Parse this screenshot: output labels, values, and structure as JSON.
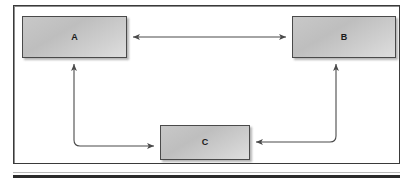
{
  "diagram": {
    "title": "",
    "frame": {
      "border_color": "#3a3a3a",
      "background": "#ffffff"
    },
    "rule": {
      "color": "#2b2b2b"
    },
    "node_style": {
      "fill_light": "#dedede",
      "fill_dark": "#c8c8c8",
      "border_color": "#4a4a4a",
      "shadow_color": "#5a5a5a",
      "label_color": "#1a1a1a"
    },
    "edge_style": {
      "color": "#4a4a4a",
      "width": 1
    },
    "nodes": [
      {
        "id": "A",
        "label": "A",
        "x": 22,
        "y": 16,
        "w": 105,
        "h": 42
      },
      {
        "id": "B",
        "label": "B",
        "x": 292,
        "y": 16,
        "w": 104,
        "h": 42
      },
      {
        "id": "C",
        "label": "C",
        "x": 160,
        "y": 125,
        "w": 90,
        "h": 35
      }
    ],
    "edges": [
      {
        "id": "a-b",
        "from": "A",
        "to": "B",
        "shape": "straight-horizontal",
        "arrowheads": "both",
        "from_side": "right",
        "to_side": "left"
      },
      {
        "id": "a-c",
        "from": "A",
        "to": "C",
        "shape": "elbow-down-right",
        "arrowheads": "both",
        "from_side": "bottom",
        "to_side": "left"
      },
      {
        "id": "c-b",
        "from": "C",
        "to": "B",
        "shape": "elbow-right-up",
        "arrowheads": "both",
        "from_side": "right",
        "to_side": "bottom"
      }
    ]
  }
}
